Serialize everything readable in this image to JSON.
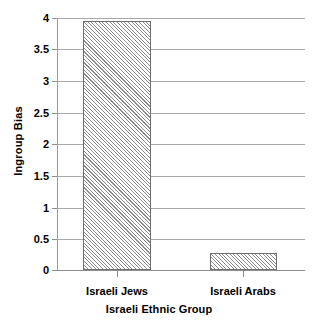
{
  "chart_data": {
    "type": "bar",
    "title": "",
    "subtitle": "",
    "xlabel": "Israeli Ethnic Group",
    "ylabel": "Ingroup Bias",
    "categories": [
      "Israeli Jews",
      "Israeli Arabs"
    ],
    "values": [
      3.95,
      0.27
    ],
    "ylim": [
      0,
      4
    ],
    "yticks": [
      0,
      0.5,
      1,
      1.5,
      2,
      2.5,
      3,
      3.5,
      4
    ],
    "ytick_labels": [
      "0",
      "0.5",
      "1",
      "1.5",
      "2",
      "2.5",
      "3",
      "3.5",
      "4"
    ],
    "grid": true,
    "legend": null,
    "legend_position": "none",
    "series": [
      {
        "name": "Ingroup Bias",
        "values": [
          3.95,
          0.27
        ],
        "fill": "diagonal-hatch",
        "fill_color": "#8c8c8c",
        "edge_color": "#6f6f6f"
      }
    ],
    "colors": {
      "background": "#ffffff",
      "gridline": "#a8a8a8",
      "axis": "#8e8e8e",
      "text": "#000000",
      "bar_hatch": "#8c8c8c",
      "bar_edge": "#6f6f6f"
    }
  }
}
